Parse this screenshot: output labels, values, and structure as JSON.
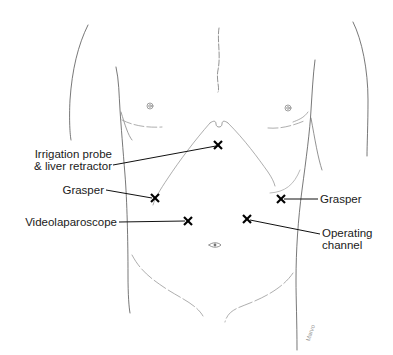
{
  "diagram": {
    "marker_symbol": "×",
    "colors": {
      "outline": "#555555",
      "faint_outline": "#999999",
      "leader_line": "#111111",
      "marker": "#000000",
      "text": "#1a1a1a",
      "background": "#ffffff"
    },
    "ports": [
      {
        "id": "irrigation",
        "label_lines": [
          "Irrigation probe",
          "& liver retractor"
        ],
        "side": "left",
        "marker_x": 218,
        "marker_y": 145
      },
      {
        "id": "grasper-left",
        "label_lines": [
          "Grasper"
        ],
        "side": "left",
        "marker_x": 155,
        "marker_y": 198
      },
      {
        "id": "videolaparoscope",
        "label_lines": [
          "Videolaparoscope"
        ],
        "side": "left",
        "marker_x": 188,
        "marker_y": 221
      },
      {
        "id": "grasper-right",
        "label_lines": [
          "Grasper"
        ],
        "side": "right",
        "marker_x": 281,
        "marker_y": 199
      },
      {
        "id": "operating-channel",
        "label_lines": [
          "Operating",
          "channel"
        ],
        "side": "right",
        "marker_x": 247,
        "marker_y": 219
      }
    ],
    "labels": {
      "irrigation_1": "Irrigation probe",
      "irrigation_2": "& liver retractor",
      "grasper_left": "Grasper",
      "videolaparoscope": "Videolaparoscope",
      "grasper_right": "Grasper",
      "operating_1": "Operating",
      "operating_2": "channel"
    },
    "signature": "Marvo"
  }
}
